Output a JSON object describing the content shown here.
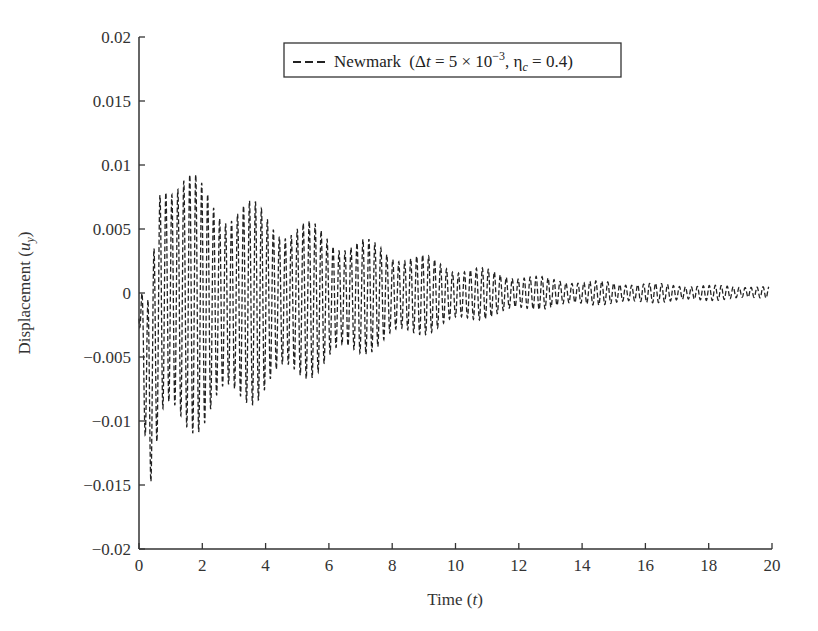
{
  "chart_data": {
    "type": "line",
    "title": "",
    "xlabel": "Time",
    "xlabel_var": "t",
    "ylabel": "Displacement",
    "ylabel_var": "u",
    "ylabel_sub": "y",
    "xlim": [
      0,
      20
    ],
    "ylim": [
      -0.02,
      0.02
    ],
    "xticks": [
      0,
      2,
      4,
      6,
      8,
      10,
      12,
      14,
      16,
      18,
      20
    ],
    "xtick_labels": [
      "0",
      "2",
      "4",
      "6",
      "8",
      "10",
      "12",
      "14",
      "16",
      "18",
      "20"
    ],
    "yticks": [
      0.02,
      0.015,
      0.01,
      0.005,
      0,
      -0.005,
      -0.01,
      -0.015,
      -0.02
    ],
    "ytick_labels": [
      "0.02",
      "0.015",
      "0.01",
      "0.005",
      "0",
      "−0.005",
      "−0.01",
      "−0.015",
      "−0.02"
    ],
    "grid": false,
    "legend_position": "upper center",
    "series": [
      {
        "name": "Newmark (Δt = 5 × 10⁻³, ηc = 0.4)",
        "line_style": "dashed",
        "color": "#222222",
        "description": "Decaying oscillation with beating; initial dip to about -0.0165 near t=0.3, peak about 0.0117 near t=0.7",
        "oscillation_frequency_cycles_per_unit": 5.3,
        "envelope": {
          "t": [
            0.0,
            0.3,
            0.7,
            1.0,
            2.0,
            3.0,
            4.0,
            5.0,
            6.0,
            7.0,
            8.0,
            9.0,
            10.0,
            11.0,
            12.0,
            13.0,
            14.0,
            15.0,
            16.0,
            17.0,
            18.0,
            19.0,
            19.9
          ],
          "upper": [
            0.0,
            0.0,
            0.0117,
            0.011,
            0.0088,
            0.0079,
            0.0068,
            0.006,
            0.0051,
            0.0044,
            0.0037,
            0.003,
            0.0023,
            0.0019,
            0.0015,
            0.0012,
            0.001,
            0.0009,
            0.0008,
            0.0007,
            0.0006,
            0.0006,
            0.0005
          ],
          "lower": [
            -0.002,
            -0.0165,
            -0.0125,
            -0.0118,
            -0.0108,
            -0.0095,
            -0.0082,
            -0.0072,
            -0.006,
            -0.005,
            -0.004,
            -0.0033,
            -0.0026,
            -0.002,
            -0.0015,
            -0.0012,
            -0.001,
            -0.0009,
            -0.0008,
            -0.0007,
            -0.0006,
            -0.0005,
            -0.0004
          ]
        }
      }
    ]
  },
  "legend": {
    "line_sample": "- - -",
    "method": "Newmark",
    "dt_symbol": "Δ",
    "dt_var": "t",
    "dt_value": "5 × 10",
    "dt_exp": "−3",
    "eta_symbol": "η",
    "eta_sub": "c",
    "eta_value": "0.4"
  },
  "axes": {
    "x_title": "Time (",
    "x_var": "t",
    "x_close": ")",
    "y_title": "Displacement (",
    "y_var": "u",
    "y_sub": "y",
    "y_close": ")"
  }
}
